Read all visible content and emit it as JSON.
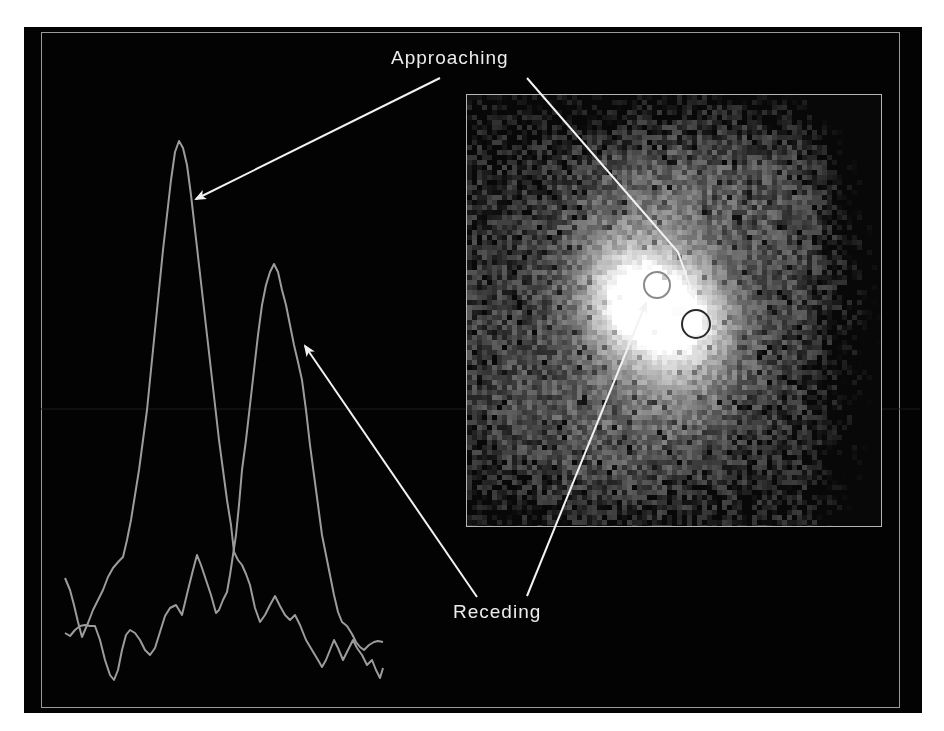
{
  "figure": {
    "background": "#030303",
    "frame_color": "#9a9a9a",
    "trace_color": "#9c9c9c",
    "annotation_color": "#f2f2f2"
  },
  "labels": {
    "approaching": "Approaching",
    "receding": "Receding"
  },
  "spectra": {
    "approaching_trace": {
      "name": "approaching-spectrum",
      "points": [
        [
          65,
          578
        ],
        [
          70,
          590
        ],
        [
          74,
          605
        ],
        [
          78,
          622
        ],
        [
          82,
          637
        ],
        [
          88,
          623
        ],
        [
          93,
          610
        ],
        [
          98,
          600
        ],
        [
          103,
          590
        ],
        [
          108,
          577
        ],
        [
          113,
          568
        ],
        [
          119,
          561
        ],
        [
          123,
          557
        ],
        [
          127,
          540
        ],
        [
          131,
          520
        ],
        [
          135,
          495
        ],
        [
          139,
          470
        ],
        [
          143,
          440
        ],
        [
          147,
          410
        ],
        [
          151,
          370
        ],
        [
          155,
          330
        ],
        [
          159,
          290
        ],
        [
          163,
          250
        ],
        [
          167,
          215
        ],
        [
          171,
          180
        ],
        [
          175,
          152
        ],
        [
          179,
          141
        ],
        [
          183,
          148
        ],
        [
          187,
          165
        ],
        [
          191,
          195
        ],
        [
          195,
          230
        ],
        [
          199,
          265
        ],
        [
          203,
          300
        ],
        [
          207,
          335
        ],
        [
          211,
          370
        ],
        [
          215,
          405
        ],
        [
          219,
          440
        ],
        [
          223,
          470
        ],
        [
          227,
          500
        ],
        [
          231,
          525
        ],
        [
          234,
          552
        ],
        [
          238,
          560
        ],
        [
          242,
          565
        ],
        [
          246,
          574
        ],
        [
          250,
          585
        ],
        [
          255,
          608
        ],
        [
          260,
          622
        ],
        [
          265,
          615
        ],
        [
          270,
          605
        ],
        [
          275,
          596
        ],
        [
          280,
          606
        ],
        [
          285,
          615
        ],
        [
          290,
          620
        ],
        [
          295,
          615
        ],
        [
          300,
          625
        ],
        [
          306,
          640
        ],
        [
          312,
          650
        ],
        [
          318,
          660
        ],
        [
          322,
          667
        ],
        [
          326,
          660
        ],
        [
          330,
          650
        ],
        [
          334,
          640
        ],
        [
          338,
          648
        ],
        [
          343,
          660
        ],
        [
          348,
          650
        ],
        [
          353,
          640
        ],
        [
          357,
          648
        ],
        [
          362,
          655
        ],
        [
          367,
          665
        ],
        [
          372,
          660
        ],
        [
          376,
          670
        ],
        [
          380,
          678
        ],
        [
          383,
          668
        ]
      ]
    },
    "receding_trace": {
      "name": "receding-spectrum",
      "points": [
        [
          65,
          633
        ],
        [
          70,
          636
        ],
        [
          75,
          630
        ],
        [
          80,
          626
        ],
        [
          85,
          625
        ],
        [
          90,
          626
        ],
        [
          95,
          626
        ],
        [
          100,
          640
        ],
        [
          105,
          660
        ],
        [
          110,
          675
        ],
        [
          114,
          680
        ],
        [
          118,
          670
        ],
        [
          122,
          650
        ],
        [
          126,
          635
        ],
        [
          130,
          630
        ],
        [
          135,
          633
        ],
        [
          140,
          640
        ],
        [
          145,
          650
        ],
        [
          150,
          655
        ],
        [
          155,
          648
        ],
        [
          160,
          632
        ],
        [
          165,
          616
        ],
        [
          170,
          608
        ],
        [
          176,
          605
        ],
        [
          182,
          615
        ],
        [
          188,
          590
        ],
        [
          193,
          570
        ],
        [
          197,
          555
        ],
        [
          201,
          565
        ],
        [
          206,
          580
        ],
        [
          211,
          595
        ],
        [
          216,
          613
        ],
        [
          219,
          610
        ],
        [
          223,
          600
        ],
        [
          227,
          592
        ],
        [
          230,
          575
        ],
        [
          233,
          555
        ],
        [
          236,
          535
        ],
        [
          239,
          505
        ],
        [
          242,
          470
        ],
        [
          246,
          440
        ],
        [
          250,
          405
        ],
        [
          254,
          370
        ],
        [
          258,
          335
        ],
        [
          262,
          305
        ],
        [
          266,
          285
        ],
        [
          270,
          272
        ],
        [
          274,
          264
        ],
        [
          278,
          272
        ],
        [
          282,
          290
        ],
        [
          286,
          305
        ],
        [
          290,
          325
        ],
        [
          294,
          345
        ],
        [
          298,
          362
        ],
        [
          302,
          380
        ],
        [
          306,
          410
        ],
        [
          310,
          445
        ],
        [
          314,
          475
        ],
        [
          318,
          505
        ],
        [
          322,
          535
        ],
        [
          326,
          555
        ],
        [
          330,
          575
        ],
        [
          334,
          595
        ],
        [
          338,
          612
        ],
        [
          342,
          622
        ],
        [
          347,
          626
        ],
        [
          352,
          634
        ],
        [
          356,
          642
        ],
        [
          360,
          647
        ],
        [
          364,
          650
        ],
        [
          369,
          645
        ],
        [
          374,
          642
        ],
        [
          378,
          641
        ],
        [
          383,
          642
        ]
      ]
    }
  },
  "image_panel": {
    "name": "galaxy-velocity-map",
    "pixel_block": 5,
    "core_center": [
      656,
      310
    ],
    "circles": [
      {
        "name": "approaching-region-circle",
        "cx": 657,
        "cy": 285,
        "r": 13,
        "color": "#8a8a8a"
      },
      {
        "name": "receding-region-circle",
        "cx": 696,
        "cy": 324,
        "r": 14,
        "color": "#2a2a2a"
      }
    ]
  },
  "arrows": [
    {
      "name": "approaching-arrow-to-spectrum",
      "points": [
        [
          440,
          78
        ],
        [
          196,
          199
        ]
      ]
    },
    {
      "name": "approaching-arrow-to-image",
      "points": [
        [
          527,
          78
        ],
        [
          678,
          252
        ],
        [
          694,
          298
        ]
      ]
    },
    {
      "name": "receding-arrow-to-spectrum",
      "points": [
        [
          477,
          597
        ],
        [
          305,
          346
        ]
      ]
    },
    {
      "name": "receding-arrow-to-image",
      "points": [
        [
          527,
          596
        ],
        [
          646,
          303
        ]
      ]
    }
  ],
  "artifacts": {
    "scan_line_y": 409
  }
}
